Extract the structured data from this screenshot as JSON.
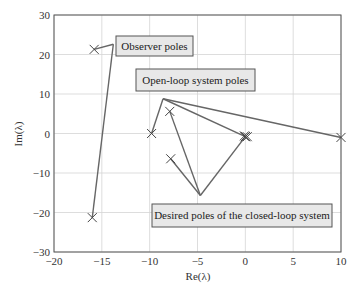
{
  "chart_data": {
    "type": "scatter",
    "title": "",
    "xlabel": "Re(λ)",
    "ylabel": "Im(λ)",
    "xlim": [
      -20,
      10
    ],
    "ylim": [
      -30,
      30
    ],
    "grid": true,
    "x_ticks": [
      -20,
      -15,
      -10,
      -5,
      0,
      5,
      10
    ],
    "y_ticks": [
      -30,
      -20,
      -10,
      0,
      10,
      20,
      30
    ],
    "x_tick_labels": [
      "−20",
      "−15",
      "−10",
      "−5",
      "0",
      "5",
      "10"
    ],
    "y_tick_labels": [
      "−30",
      "−20",
      "−10",
      "0",
      "10",
      "20",
      "30"
    ],
    "marker": "x",
    "series": [
      {
        "name": "Observer poles",
        "points": [
          [
            -15.8,
            21.3
          ],
          [
            -16.0,
            -21.3
          ]
        ]
      },
      {
        "name": "Open-loop system poles",
        "points": [
          [
            -9.8,
            0.0
          ],
          [
            0.0,
            -0.8
          ],
          [
            0.2,
            -0.8
          ],
          [
            -0.1,
            -0.6
          ],
          [
            10.0,
            -1.0
          ]
        ]
      },
      {
        "name": "Desired poles of the closed-loop system",
        "points": [
          [
            -7.9,
            5.6
          ],
          [
            -7.8,
            -6.4
          ],
          [
            0.0,
            -0.8
          ]
        ]
      }
    ],
    "annotations": [
      {
        "text": "Observer poles",
        "anchor": [
          -13.8,
          22.6
        ],
        "targets": [
          [
            -15.8,
            21.3
          ],
          [
            -16.0,
            -21.3
          ]
        ]
      },
      {
        "text": "Open-loop system poles",
        "anchor": [
          -8.6,
          8.8
        ],
        "targets": [
          [
            -9.8,
            0.0
          ],
          [
            0.0,
            -0.8
          ],
          [
            10.0,
            -1.0
          ]
        ]
      },
      {
        "text": "Desired poles of the closed-loop system",
        "anchor": [
          -4.7,
          -15.7
        ],
        "targets": [
          [
            -7.9,
            5.6
          ],
          [
            -7.8,
            -6.4
          ],
          [
            0.0,
            -0.8
          ]
        ]
      }
    ]
  }
}
